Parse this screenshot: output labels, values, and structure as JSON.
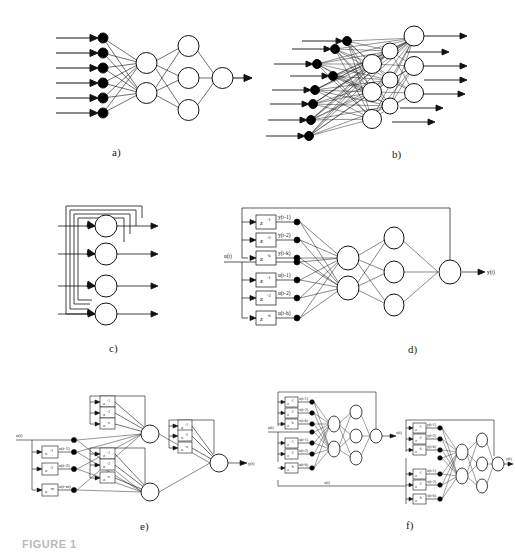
{
  "figure": {
    "caption": "FIGURE 1",
    "panels": [
      {
        "id": "a",
        "label": "a)",
        "title": "feedforward-network"
      },
      {
        "id": "b",
        "label": "b)",
        "title": "fully-connected-network"
      },
      {
        "id": "c",
        "label": "c)",
        "title": "recurrent-network"
      },
      {
        "id": "d",
        "label": "d)",
        "title": "narx-network"
      },
      {
        "id": "e",
        "label": "e)",
        "title": "locally-recurrent-network"
      },
      {
        "id": "f",
        "label": "f)",
        "title": "cascaded-network"
      }
    ]
  },
  "panel_a": {
    "label": "a)",
    "inputs": 6,
    "layers": [
      6,
      2,
      3,
      1
    ],
    "output_arrow": true
  },
  "panel_b": {
    "label": "b)",
    "inputs": 8,
    "layers": [
      8,
      4,
      4,
      4
    ],
    "outputs": 6
  },
  "panel_c": {
    "label": "c)",
    "nodes": 4,
    "feedback": true
  },
  "panel_d": {
    "label": "d)",
    "input_signal": "u(t)",
    "output_signal": "y(t)",
    "delay_blocks_y": [
      {
        "block": "z",
        "exp": "-1",
        "signal": "y(t-1)"
      },
      {
        "block": "z",
        "exp": "-2",
        "signal": "y(t-2)"
      },
      {
        "block": "z",
        "exp": "-k",
        "signal": "y(t-k)"
      }
    ],
    "delay_blocks_u": [
      {
        "block": "z",
        "exp": "-1",
        "signal": "u(t-1)"
      },
      {
        "block": "z",
        "exp": "-2",
        "signal": "u(t-2)"
      },
      {
        "block": "z",
        "exp": "-h",
        "signal": "u(t-h)"
      }
    ],
    "layers": [
      8,
      2,
      3,
      1
    ]
  },
  "panel_e": {
    "label": "e)",
    "input_signal": "u(t)",
    "output_signal": "y(t)",
    "input_delays": [
      {
        "block": "z",
        "exp": "-1",
        "signal": "u(t-1)"
      },
      {
        "block": "z",
        "exp": "-2",
        "signal": "u(t-2)"
      },
      {
        "block": "z",
        "exp": "-m",
        "signal": "u(t-m)"
      }
    ],
    "local_delays": [
      {
        "block": "z",
        "exp": "-1"
      },
      {
        "block": "z",
        "exp": "-2"
      },
      {
        "block": "z",
        "exp": "-n"
      }
    ],
    "hidden_neurons": 2,
    "output_neurons": 1
  },
  "panel_f": {
    "label": "f)",
    "input_signal": "u(t)",
    "mid_signal": "x(t)",
    "mid_feedback": "x(t)",
    "output_signal": "y(t)",
    "block1_delays_x": [
      {
        "block": "z",
        "exp": "-1",
        "signal": "x(t-1)"
      },
      {
        "block": "z",
        "exp": "-2",
        "signal": "x(t-2)"
      },
      {
        "block": "z",
        "exp": "-k",
        "signal": "x(t-k)"
      }
    ],
    "block1_delays_u": [
      {
        "block": "z",
        "exp": "-1",
        "signal": "u(t-1)"
      },
      {
        "block": "z",
        "exp": "-2",
        "signal": "u(t-2)"
      },
      {
        "block": "z",
        "exp": "-h",
        "signal": "u(t-h)"
      }
    ],
    "block2_delays_y": [
      {
        "block": "z",
        "exp": "-1",
        "signal": "y(t-1)"
      },
      {
        "block": "z",
        "exp": "-2",
        "signal": "y(t-2)"
      },
      {
        "block": "z",
        "exp": "-k",
        "signal": "y(t-k)"
      }
    ],
    "block2_delays_x": [
      {
        "block": "z",
        "exp": "-1",
        "signal": "x(t-1)"
      },
      {
        "block": "z",
        "exp": "-2",
        "signal": "x(t-2)"
      },
      {
        "block": "z",
        "exp": "-h",
        "signal": "x(t-h)"
      }
    ]
  },
  "colors": {
    "stroke": "#111111",
    "node_fill": "#ffffff",
    "input_fill": "#000000",
    "background": "#ffffff"
  }
}
